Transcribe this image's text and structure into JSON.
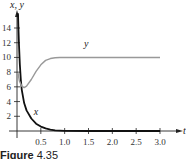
{
  "chart_data": {
    "type": "line",
    "title": "",
    "xlabel": "t",
    "ylabel": "x, y",
    "xlim": [
      0,
      3.0
    ],
    "ylim": [
      0,
      16
    ],
    "x_ticks": [
      "0.5",
      "1.0",
      "1.5",
      "2.0",
      "2.5",
      "3.0"
    ],
    "y_ticks": [
      "2",
      "4",
      "6",
      "8",
      "10",
      "12",
      "14"
    ],
    "grid": false,
    "legend": "inline labels",
    "series": [
      {
        "name": "x",
        "color": "#111111",
        "t": [
          0.02,
          0.04,
          0.06,
          0.08,
          0.1,
          0.15,
          0.2,
          0.3,
          0.4,
          0.5,
          0.6,
          0.7,
          0.8,
          1.0,
          1.5,
          2.0,
          2.5,
          3.0
        ],
        "values": [
          16.0,
          12.0,
          9.0,
          7.0,
          5.6,
          3.8,
          2.8,
          1.7,
          1.0,
          0.6,
          0.35,
          0.18,
          0.08,
          0.02,
          0,
          0,
          0,
          0
        ]
      },
      {
        "name": "y",
        "color": "#999999",
        "t": [
          0.02,
          0.05,
          0.1,
          0.15,
          0.2,
          0.3,
          0.4,
          0.5,
          0.6,
          0.7,
          0.8,
          0.9,
          1.0,
          1.5,
          2.0,
          2.5,
          3.0
        ],
        "values": [
          7.9,
          6.8,
          6.1,
          5.9,
          6.1,
          7.0,
          8.1,
          9.0,
          9.6,
          9.85,
          9.95,
          10.0,
          10.0,
          10.0,
          10.0,
          10.0,
          10.0
        ]
      }
    ],
    "annotations": [
      {
        "text": "y",
        "t": 1.45,
        "value": 11.4
      },
      {
        "text": "x",
        "t": 0.4,
        "value": 2.2
      }
    ],
    "caption": {
      "label": "Figure",
      "number": "4.35"
    }
  }
}
